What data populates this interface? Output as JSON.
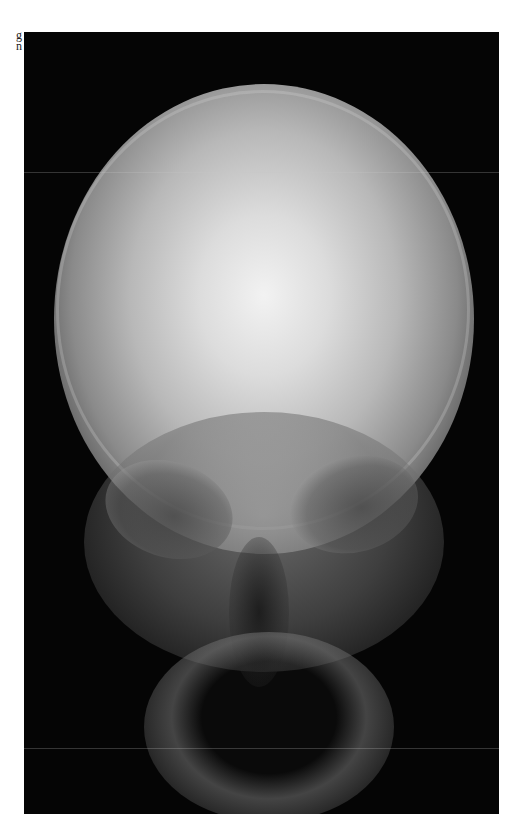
{
  "margin_text": {
    "line1": "g",
    "line2": "n"
  },
  "figure": {
    "type": "radiograph",
    "background_color": "#050505"
  }
}
